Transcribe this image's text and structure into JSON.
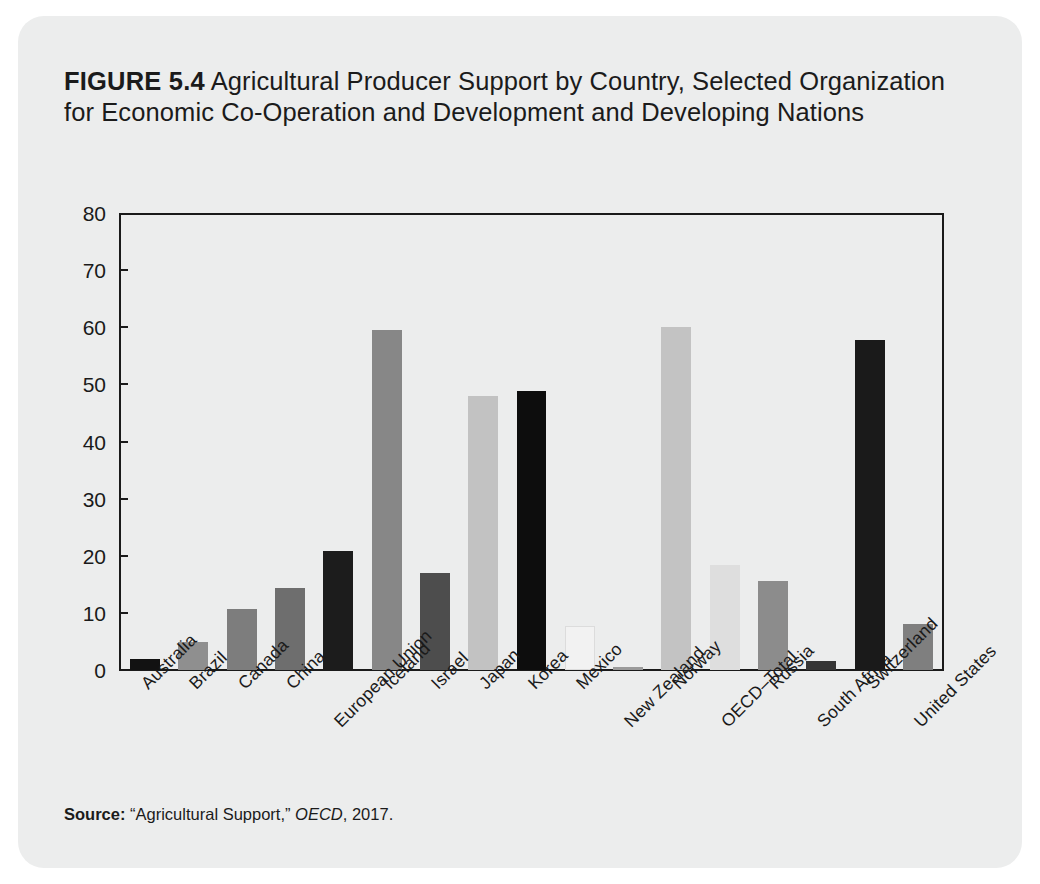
{
  "figure": {
    "label": "FIGURE 5.4",
    "title_rest": " Agricultural Producer Support by Country, Selected Organization for Economic Co-Operation and Development and Developing Nations",
    "source_label": "Source:",
    "source_text": " “Agricultural Support,” ",
    "source_italic": "OECD",
    "source_suffix": ", 2017."
  },
  "chart_data": {
    "type": "bar",
    "title": "FIGURE 5.4 Agricultural Producer Support by Country, Selected Organization for Economic Co-Operation and Development and Developing Nations",
    "xlabel": "",
    "ylabel": "",
    "ylim": [
      0,
      80
    ],
    "yticks": [
      0,
      10,
      20,
      30,
      40,
      50,
      60,
      70,
      80
    ],
    "grid": false,
    "legend": "none",
    "categories": [
      "Australia",
      "Brazil",
      "Canada",
      "China",
      "European Union",
      "Iceland",
      "Israel",
      "Japan",
      "Korea",
      "Mexico",
      "New Zealand",
      "Norway",
      "OECD–Total",
      "Russia",
      "South Africa",
      "Switzerland",
      "United States"
    ],
    "values": [
      1.9,
      4.9,
      10.6,
      14.3,
      20.9,
      59.6,
      16.9,
      47.9,
      48.9,
      7.7,
      0.6,
      60.1,
      18.3,
      15.6,
      1.6,
      57.7,
      8.1
    ],
    "bar_colors": [
      "#121212",
      "#8f8f8f",
      "#7d7d7d",
      "#6e6e6e",
      "#1c1c1c",
      "#878787",
      "#4d4d4d",
      "#c2c2c2",
      "#0d0d0d",
      "#f2f2f2",
      "#9a9a9a",
      "#c3c3c3",
      "#dedede",
      "#8c8c8c",
      "#363636",
      "#1a1a1a",
      "#7f7f7f"
    ],
    "source": "Source: “Agricultural Support,” OECD, 2017."
  }
}
